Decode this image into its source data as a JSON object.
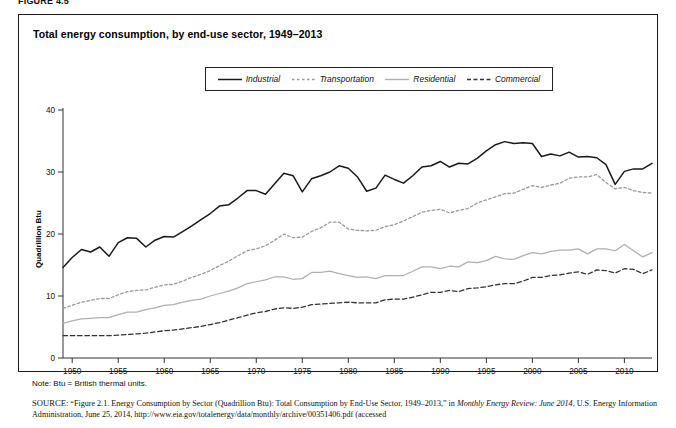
{
  "figure": {
    "label": "FIGURE 4.5"
  },
  "chart": {
    "title": "Total energy consumption, by end-use sector, 1949–2013",
    "ylabel": "Quadrillion Btu"
  },
  "legend": {
    "position": "top-center",
    "items": [
      {
        "label": "Industrial",
        "style": "solid",
        "color": "#1a1a1a",
        "icon": "line-solid-icon"
      },
      {
        "label": "Transportation",
        "style": "dotted",
        "color": "#9a9a9a",
        "icon": "line-dotted-icon"
      },
      {
        "label": "Residential",
        "style": "solid-light",
        "color": "#b0b0b0",
        "icon": "line-solid-light-icon"
      },
      {
        "label": "Commercial",
        "style": "dashed",
        "color": "#333333",
        "icon": "line-dashed-icon"
      }
    ]
  },
  "notes": {
    "note": "Note: Btu = British thermal units."
  },
  "source": {
    "prefix": "SOURCE:",
    "line1_a": "“Figure 2.1. Energy Consumption by Sector (Quadrillion Btu): Total Consumption by End-Use Sector, 1949–2013,” in ",
    "line1_italic": "Monthly Energy Review:",
    "line2_italic": "June 2014",
    "line2_b": ", U.S. Energy Information Administration, June 25, 2014, http://www.eia.gov/totalenergy/data/monthly/archive/00351406.pdf (accessed"
  },
  "chart_data": {
    "type": "line",
    "title": "Total energy consumption, by end-use sector, 1949–2013",
    "xlabel": "",
    "ylabel": "Quadrillion Btu",
    "xlim": [
      1949,
      2013
    ],
    "ylim": [
      0,
      40
    ],
    "yticks": [
      0,
      10,
      20,
      30,
      40
    ],
    "xticks": [
      1950,
      1955,
      1960,
      1965,
      1970,
      1975,
      1980,
      1985,
      1990,
      1995,
      2000,
      2005,
      2010
    ],
    "grid": false,
    "legend_position": "top-center",
    "x": [
      1949,
      1950,
      1951,
      1952,
      1953,
      1954,
      1955,
      1956,
      1957,
      1958,
      1959,
      1960,
      1961,
      1962,
      1963,
      1964,
      1965,
      1966,
      1967,
      1968,
      1969,
      1970,
      1971,
      1972,
      1973,
      1974,
      1975,
      1976,
      1977,
      1978,
      1979,
      1980,
      1981,
      1982,
      1983,
      1984,
      1985,
      1986,
      1987,
      1988,
      1989,
      1990,
      1991,
      1992,
      1993,
      1994,
      1995,
      1996,
      1997,
      1998,
      1999,
      2000,
      2001,
      2002,
      2003,
      2004,
      2005,
      2006,
      2007,
      2008,
      2009,
      2010,
      2011,
      2012,
      2013
    ],
    "series": [
      {
        "name": "Industrial",
        "style": "solid",
        "color": "#1a1a1a",
        "values": [
          14.6,
          16.2,
          17.5,
          17.1,
          17.9,
          16.4,
          18.6,
          19.4,
          19.3,
          17.9,
          19.0,
          19.6,
          19.5,
          20.4,
          21.3,
          22.3,
          23.3,
          24.5,
          24.7,
          25.8,
          27.0,
          27.0,
          26.4,
          28.1,
          29.8,
          29.4,
          26.8,
          28.9,
          29.4,
          30.0,
          31.0,
          30.6,
          29.2,
          26.9,
          27.4,
          29.5,
          28.8,
          28.2,
          29.4,
          30.8,
          31.0,
          31.7,
          30.8,
          31.4,
          31.3,
          32.2,
          33.4,
          34.4,
          34.9,
          34.6,
          34.7,
          34.6,
          32.5,
          32.9,
          32.6,
          33.2,
          32.4,
          32.5,
          32.3,
          31.2,
          28.0,
          30.1,
          30.5,
          30.5,
          31.4
        ]
      },
      {
        "name": "Transportation",
        "style": "dotted",
        "color": "#9a9a9a",
        "values": [
          8.0,
          8.5,
          9.0,
          9.3,
          9.6,
          9.6,
          10.2,
          10.7,
          10.9,
          11.0,
          11.4,
          11.8,
          11.9,
          12.4,
          13.0,
          13.5,
          14.1,
          14.9,
          15.6,
          16.5,
          17.3,
          17.6,
          18.1,
          19.0,
          20.0,
          19.4,
          19.5,
          20.4,
          21.0,
          21.9,
          21.9,
          20.8,
          20.6,
          20.5,
          20.6,
          21.2,
          21.5,
          22.1,
          22.8,
          23.5,
          23.8,
          24.0,
          23.4,
          23.8,
          24.1,
          25.0,
          25.5,
          26.0,
          26.5,
          26.6,
          27.2,
          27.8,
          27.5,
          27.9,
          28.2,
          29.0,
          29.2,
          29.2,
          29.6,
          28.3,
          27.3,
          27.5,
          27.0,
          26.7,
          26.6
        ]
      },
      {
        "name": "Residential",
        "style": "solid-light",
        "color": "#b0b0b0",
        "values": [
          5.6,
          6.0,
          6.3,
          6.4,
          6.5,
          6.5,
          7.0,
          7.4,
          7.4,
          7.8,
          8.1,
          8.5,
          8.6,
          9.0,
          9.3,
          9.5,
          10.0,
          10.4,
          10.8,
          11.3,
          12.0,
          12.3,
          12.6,
          13.1,
          13.1,
          12.7,
          12.8,
          13.8,
          13.8,
          14.0,
          13.6,
          13.3,
          13.0,
          13.1,
          12.8,
          13.3,
          13.3,
          13.3,
          14.0,
          14.7,
          14.7,
          14.4,
          14.8,
          14.7,
          15.5,
          15.4,
          15.7,
          16.4,
          16.0,
          15.9,
          16.5,
          17.0,
          16.8,
          17.2,
          17.4,
          17.4,
          17.6,
          16.8,
          17.6,
          17.6,
          17.3,
          18.3,
          17.3,
          16.3,
          17.0
        ]
      },
      {
        "name": "Commercial",
        "style": "dashed",
        "color": "#333333",
        "values": [
          3.6,
          3.6,
          3.6,
          3.6,
          3.6,
          3.6,
          3.7,
          3.8,
          3.9,
          4.0,
          4.2,
          4.4,
          4.5,
          4.7,
          4.9,
          5.1,
          5.4,
          5.7,
          6.1,
          6.5,
          6.9,
          7.3,
          7.5,
          7.9,
          8.1,
          8.0,
          8.2,
          8.6,
          8.7,
          8.8,
          8.9,
          9.0,
          8.9,
          8.9,
          8.9,
          9.4,
          9.5,
          9.5,
          9.8,
          10.2,
          10.6,
          10.6,
          10.9,
          10.7,
          11.2,
          11.3,
          11.5,
          11.8,
          12.0,
          12.0,
          12.4,
          13.0,
          13.0,
          13.3,
          13.4,
          13.7,
          13.9,
          13.5,
          14.2,
          14.1,
          13.7,
          14.4,
          14.3,
          13.6,
          14.2
        ]
      }
    ]
  }
}
